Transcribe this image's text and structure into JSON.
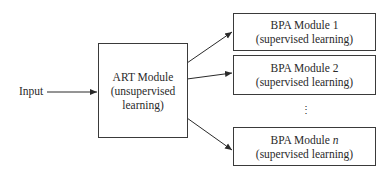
{
  "diagram": {
    "input_label": "Input",
    "art_module": {
      "title": "ART Module",
      "subtitle_line1": "(unsupervised",
      "subtitle_line2": "learning)"
    },
    "bpa_modules": [
      {
        "title": "BPA Module 1",
        "subtitle": "(supervised learning)"
      },
      {
        "title": "BPA Module 2",
        "subtitle": "(supervised learning)"
      },
      {
        "title_prefix": "BPA Module ",
        "title_var": "n",
        "subtitle": "(supervised learning)"
      }
    ],
    "ellipsis": "⋮",
    "edges": [
      {
        "from": "Input",
        "to": "ART Module"
      },
      {
        "from": "ART Module",
        "to": "BPA Module 1"
      },
      {
        "from": "ART Module",
        "to": "BPA Module 2"
      },
      {
        "from": "ART Module",
        "to": "BPA Module n"
      }
    ]
  }
}
